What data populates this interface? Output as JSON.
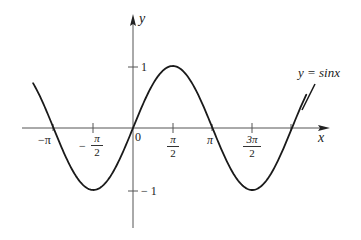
{
  "chart_data": {
    "type": "line",
    "title": "",
    "curve_label": "y = sinx",
    "xlabel": "x",
    "ylabel": "y",
    "x_ticks": [
      {
        "value": -3.14159,
        "label": "−π"
      },
      {
        "value": -1.5708,
        "label": "−π/2"
      },
      {
        "value": 0,
        "label": "0"
      },
      {
        "value": 1.5708,
        "label": "π/2"
      },
      {
        "value": 3.14159,
        "label": "π"
      },
      {
        "value": 4.71239,
        "label": "3π/2"
      }
    ],
    "y_ticks": [
      {
        "value": 1,
        "label": "1"
      },
      {
        "value": -1,
        "label": "−1"
      }
    ],
    "xlim": [
      -4.1,
      6.9
    ],
    "ylim": [
      -1.6,
      1.8
    ],
    "grid": false,
    "legend": "none",
    "series": [
      {
        "name": "y = sin x",
        "x": [
          -3.95,
          -3.14159,
          -2.35619,
          -1.5708,
          -0.7854,
          0,
          0.7854,
          1.5708,
          2.35619,
          3.14159,
          3.92699,
          4.71239,
          5.49779,
          6.28319,
          6.85
        ],
        "values": [
          0.72,
          0,
          -0.707,
          -1,
          -0.707,
          0,
          0.707,
          1,
          0.707,
          0,
          -0.707,
          -1,
          -0.707,
          0,
          0.54
        ]
      }
    ]
  },
  "labels": {
    "y_axis": "y",
    "x_axis": "x",
    "origin": "0",
    "curve": "y = sinx",
    "y_one": "1",
    "y_neg_one": "− 1",
    "x_neg_pi": "−π",
    "x_neg_half_pi_sign": "−",
    "x_half_pi_num": "π",
    "x_half_pi_den": "2",
    "x_pi": "π",
    "x_three_half_pi_num": "3π",
    "x_three_half_pi_den": "2"
  },
  "colors": {
    "curve": "#1a1a1a",
    "axis": "#555555",
    "background": "#ffffff"
  }
}
